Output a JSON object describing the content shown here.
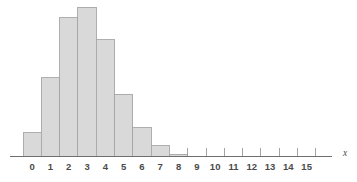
{
  "chart_data": {
    "type": "bar",
    "title": "",
    "subtitle": "",
    "xlabel": "x",
    "ylabel": "",
    "grid": false,
    "legend": null,
    "xlim": [
      -0.5,
      15.5
    ],
    "ylim": [
      0,
      0.25
    ],
    "categories": [
      "0",
      "1",
      "2",
      "3",
      "4",
      "5",
      "6",
      "7",
      "8",
      "9",
      "10",
      "11",
      "12",
      "13",
      "14",
      "15"
    ],
    "tick_labels": [
      "0",
      "1",
      "2",
      "3",
      "4",
      "5",
      "6",
      "7",
      "8",
      "9",
      "10",
      "11",
      "12",
      "13",
      "14",
      "15"
    ],
    "values": [
      0.039,
      0.131,
      0.232,
      0.25,
      0.195,
      0.104,
      0.047,
      0.017,
      0.003,
      0,
      0,
      0,
      0,
      0,
      0,
      0
    ],
    "bars": [
      {
        "category": "0",
        "value": 0.039
      },
      {
        "category": "1",
        "value": 0.131
      },
      {
        "category": "2",
        "value": 0.232
      },
      {
        "category": "3",
        "value": 0.25
      },
      {
        "category": "4",
        "value": 0.195
      },
      {
        "category": "5",
        "value": 0.104
      },
      {
        "category": "6",
        "value": 0.047
      },
      {
        "category": "7",
        "value": 0.017
      },
      {
        "category": "8",
        "value": 0.003
      },
      {
        "category": "9",
        "value": 0
      },
      {
        "category": "10",
        "value": 0
      },
      {
        "category": "11",
        "value": 0
      },
      {
        "category": "12",
        "value": 0
      },
      {
        "category": "13",
        "value": 0
      },
      {
        "category": "14",
        "value": 0
      },
      {
        "category": "15",
        "value": 0
      }
    ],
    "annotations": []
  },
  "style": {
    "bar_fill": "#d9d9d9",
    "bar_stroke": "#a6a6a6",
    "axis_color": "#6e6e6e",
    "tick_color": "#9a9a9a",
    "label_color": "#4a4a4a",
    "background": "#ffffff"
  },
  "geometry": {
    "baseline_y": 156,
    "first_bar_left": 23,
    "bar_width": 18.3,
    "max_bar_height": 149,
    "axis_left": 10,
    "axis_right": 332,
    "label_y": 170,
    "tick_top": 148,
    "axis_name_x": 345,
    "axis_name_y": 156
  }
}
